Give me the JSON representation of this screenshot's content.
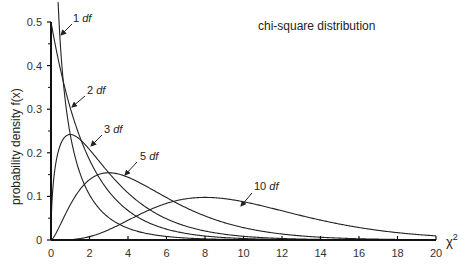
{
  "chart_data": {
    "type": "line",
    "title": "chi-square distribution",
    "xlabel": "χ2",
    "ylabel": "probability density f(x)",
    "xlim": [
      0,
      20
    ],
    "ylim": [
      0,
      0.5
    ],
    "xticks": [
      "0",
      "2",
      "4",
      "6",
      "8",
      "10",
      "12",
      "14",
      "16",
      "18",
      "20"
    ],
    "yticks": [
      "0",
      "0.1",
      "0.2",
      "0.3",
      "0.4",
      "0.5"
    ],
    "grid": false,
    "legend": "inline annotations with arrows",
    "series": [
      {
        "name": "1 df",
        "df": 1,
        "label": "1",
        "unit": "df"
      },
      {
        "name": "2 df",
        "df": 2,
        "label": "2",
        "unit": "df"
      },
      {
        "name": "3 df",
        "df": 3,
        "label": "3",
        "unit": "df"
      },
      {
        "name": "5 df",
        "df": 5,
        "label": "5",
        "unit": "df"
      },
      {
        "name": "10 df",
        "df": 10,
        "label": "10",
        "unit": "df"
      }
    ],
    "peaks": [
      {
        "df": 2,
        "x": 0,
        "y": 0.5
      },
      {
        "df": 3,
        "x": 1,
        "y": 0.242
      },
      {
        "df": 5,
        "x": 3,
        "y": 0.154
      },
      {
        "df": 10,
        "x": 8,
        "y": 0.098
      }
    ]
  }
}
